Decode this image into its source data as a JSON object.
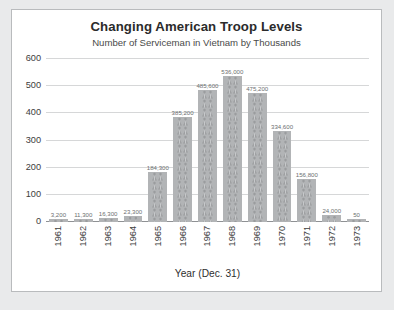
{
  "chart_data": {
    "type": "bar",
    "title": "Changing American Troop Levels",
    "subtitle": "Number of Serviceman in Vietnam by Thousands",
    "xlabel": "Year (Dec. 31)",
    "ylabel": "",
    "ylim": [
      0,
      600
    ],
    "yticks": [
      0,
      100,
      200,
      300,
      400,
      500,
      600
    ],
    "ytick_labels": [
      "0",
      "100",
      "200",
      "300",
      "400",
      "500",
      "600"
    ],
    "grid": true,
    "legend": "none",
    "units": "thousands",
    "bar_fill_color": "#b2b4b6",
    "categories": [
      "1961",
      "1962",
      "1963",
      "1964",
      "1965",
      "1966",
      "1967",
      "1968",
      "1969",
      "1970",
      "1971",
      "1972",
      "1973"
    ],
    "values": [
      3.2,
      11.3,
      16.3,
      23.3,
      184.3,
      385.2,
      485.6,
      536.1,
      475.2,
      334.6,
      156.8,
      24.0,
      0.05
    ],
    "data_labels": [
      "3,200",
      "11,300",
      "16,300",
      "23,300",
      "184,300",
      "385,200",
      "485,600",
      "536,000",
      "475,200",
      "334,600",
      "156,800",
      "24,000",
      "50"
    ]
  },
  "panel": {
    "background": "#ffffff",
    "border_color": "#b9bbbd",
    "page_background": "#e9eaeb"
  }
}
